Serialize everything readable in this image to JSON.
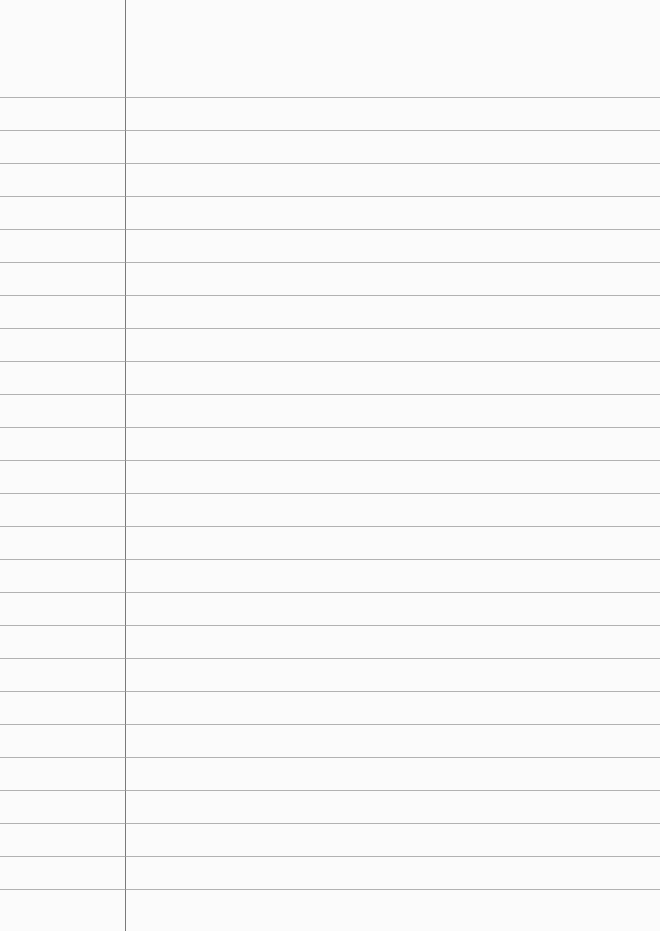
{
  "paper": {
    "type": "lined-paper",
    "background": "#fbfbfb",
    "rule_color": "#9a9a9a",
    "margin_color": "#7a7a7a",
    "margin_x": 125,
    "first_rule_y": 97,
    "rule_spacing": 33,
    "rule_count": 25
  }
}
